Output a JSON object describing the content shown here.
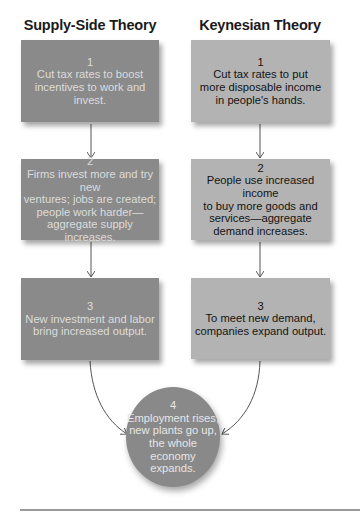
{
  "columns": {
    "supply": {
      "title": "Supply-Side Theory",
      "steps": [
        {
          "num": "1",
          "text": "Cut tax rates to boost\nincentives to work and invest."
        },
        {
          "num": "2",
          "text": "Firms invest more and try new\nventures; jobs are created;\npeople work harder—\naggregate supply increases."
        },
        {
          "num": "3",
          "text": "New investment and labor\nbring increased output."
        }
      ]
    },
    "keynesian": {
      "title": "Keynesian Theory",
      "steps": [
        {
          "num": "1",
          "text": "Cut tax rates to put\nmore disposable income\nin people's hands."
        },
        {
          "num": "2",
          "text": "People use increased income\nto buy more goods and\nservices—aggregate\ndemand increases."
        },
        {
          "num": "3",
          "text": "To meet new demand,\ncompanies expand output."
        }
      ]
    }
  },
  "outcome": {
    "num": "4",
    "text": "Employment rises,\nnew plants go up,\nthe whole economy\nexpands."
  },
  "colors": {
    "supply_box": "#8a8a8a",
    "keynesian_box": "#b3b3b3",
    "outcome_circle": "#898989",
    "arrow": "#555555"
  }
}
